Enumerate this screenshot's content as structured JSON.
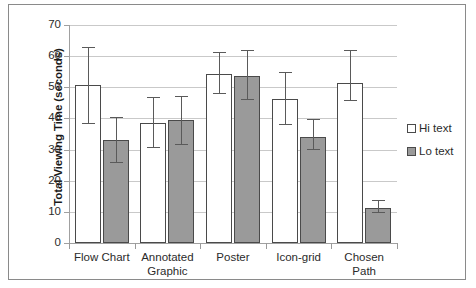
{
  "chart_data": {
    "type": "bar",
    "title": "",
    "xlabel": "",
    "ylabel": "Total Viewing Time (seconds)",
    "ylim": [
      0,
      70
    ],
    "ytick_step": 10,
    "yticks": [
      "70",
      "60",
      "50",
      "40",
      "30",
      "20",
      "10",
      "0"
    ],
    "grid": true,
    "legend_position": "right",
    "categories": [
      "Flow Chart",
      "Annotated Graphic",
      "Poster",
      "Icon-grid",
      "Chosen Path"
    ],
    "category_lines": [
      [
        "Flow Chart"
      ],
      [
        "Annotated",
        "Graphic"
      ],
      [
        "Poster"
      ],
      [
        "Icon-grid"
      ],
      [
        "Chosen",
        "Path"
      ]
    ],
    "series": [
      {
        "name": "Hi text",
        "color": "#ffffff",
        "edge_color": "#4a4a4a",
        "values": [
          50.8,
          38.5,
          54.3,
          46.3,
          51.5
        ],
        "err_low": [
          38.2,
          30.6,
          47.8,
          38.0,
          45.6
        ],
        "err_high": [
          62.5,
          46.6,
          61.0,
          54.5,
          61.5
        ]
      },
      {
        "name": "Lo text",
        "color": "#9a9a9a",
        "edge_color": "#4a4a4a",
        "values": [
          33.2,
          39.5,
          53.7,
          34.0,
          11.2
        ],
        "err_low": [
          25.7,
          31.5,
          45.8,
          29.8,
          9.5
        ],
        "err_high": [
          40.3,
          47.0,
          61.5,
          39.5,
          13.5
        ]
      }
    ]
  },
  "legend": {
    "items": [
      {
        "label": "Hi text",
        "swatch": "open-square-swatch"
      },
      {
        "label": "Lo text",
        "swatch": "filled-square-swatch"
      }
    ]
  },
  "colors": {
    "hi_text_bar": "#ffffff",
    "lo_text_bar": "#9a9a9a",
    "bar_edge": "#4a4a4a",
    "gridline": "#c9c9c9",
    "axis": "#a0a0a0",
    "frame": "#8a8a8a",
    "text": "#2b2b2b",
    "background": "#ffffff"
  }
}
